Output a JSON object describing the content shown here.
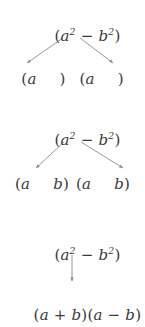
{
  "page": {
    "background_color": "#ffffff",
    "text_color": "#3a3a3a",
    "arrow_color": "#8c8c8c"
  },
  "stages": [
    {
      "name": "stage-1-empty-binomials",
      "parent": {
        "open": "(",
        "base1": "a",
        "exp1": "2",
        "operator": " − ",
        "base2": "b",
        "exp2": "2",
        "close": ")"
      },
      "children": [
        {
          "open": "(",
          "first": "a",
          "gap": "  ",
          "second": "",
          "close": ")"
        },
        {
          "open": "(",
          "first": "a",
          "gap": "  ",
          "second": "",
          "close": ")"
        }
      ]
    },
    {
      "name": "stage-2-terms-filled",
      "parent": {
        "open": "(",
        "base1": "a",
        "exp1": "2",
        "operator": " − ",
        "base2": "b",
        "exp2": "2",
        "close": ")"
      },
      "children": [
        {
          "open": "(",
          "first": "a",
          "gap": "  ",
          "second": "b",
          "close": ")"
        },
        {
          "open": "(",
          "first": "a",
          "gap": "  ",
          "second": "b",
          "close": ")"
        }
      ]
    },
    {
      "name": "stage-3-complete-factorization",
      "parent": {
        "open": "(",
        "base1": "a",
        "exp1": "2",
        "operator": " − ",
        "base2": "b",
        "exp2": "2",
        "close": ")"
      },
      "result": {
        "open1": "(",
        "a1": "a",
        "op1": " + ",
        "b1": "b",
        "close1": ")",
        "open2": "(",
        "a2": "a",
        "op2": " − ",
        "b2": "b",
        "close2": ")"
      }
    }
  ]
}
